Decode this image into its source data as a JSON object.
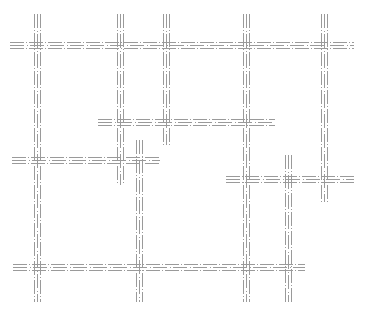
{
  "diagram": {
    "background": "#ffffff",
    "line_color": "#9a9a9a",
    "line_style": "triple-parallel-dash-dot",
    "track_spacing": 3,
    "dash_pattern": "14 2 1 2",
    "horizontal_tracks": [
      {
        "id": "h1",
        "y": 45,
        "x1": 10,
        "x2": 354
      },
      {
        "id": "h2",
        "y": 122,
        "x1": 98,
        "x2": 275
      },
      {
        "id": "h3",
        "y": 160,
        "x1": 12,
        "x2": 160
      },
      {
        "id": "h4",
        "y": 179,
        "x1": 226,
        "x2": 354
      },
      {
        "id": "h5",
        "y": 267,
        "x1": 13,
        "x2": 305
      }
    ],
    "vertical_tracks": [
      {
        "id": "v1",
        "x": 37,
        "y1": 14,
        "y2": 302
      },
      {
        "id": "v2",
        "x": 120,
        "y1": 14,
        "y2": 185
      },
      {
        "id": "v3",
        "x": 166,
        "y1": 14,
        "y2": 145
      },
      {
        "id": "v4",
        "x": 246,
        "y1": 14,
        "y2": 302
      },
      {
        "id": "v5",
        "x": 324,
        "y1": 14,
        "y2": 202
      },
      {
        "id": "v6",
        "x": 139,
        "y1": 140,
        "y2": 302
      },
      {
        "id": "v7",
        "x": 288,
        "y1": 155,
        "y2": 302
      }
    ]
  }
}
